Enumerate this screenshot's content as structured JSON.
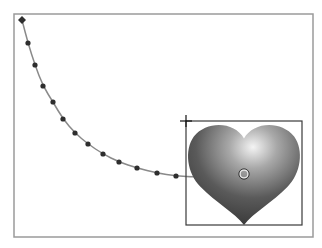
{
  "canvas": {
    "frame": {
      "x": 14,
      "y": 14,
      "w": 299,
      "h": 223,
      "stroke": "#9a9a9a"
    },
    "motion_path": {
      "stroke": "#8a8a8a",
      "dot_color": "#2e2e2e",
      "start_marker": {
        "x": 22,
        "y": 20
      },
      "points": [
        [
          28,
          43
        ],
        [
          35,
          65
        ],
        [
          43,
          86
        ],
        [
          53,
          102
        ],
        [
          63,
          119
        ],
        [
          75,
          133
        ],
        [
          88,
          144
        ],
        [
          103,
          154
        ],
        [
          119,
          162
        ],
        [
          137,
          168
        ],
        [
          157,
          173
        ],
        [
          176,
          176
        ],
        [
          197,
          177
        ],
        [
          221,
          175
        ]
      ],
      "end": {
        "x": 244,
        "y": 174
      }
    },
    "heart": {
      "x": 187,
      "y": 122,
      "w": 114,
      "h": 103,
      "highlight": "#f2f2f2",
      "mid": "#8c8c8c",
      "dark": "#3a3a3a"
    },
    "selection_box": {
      "x": 186,
      "y": 121,
      "w": 116,
      "h": 104,
      "stroke": "#3a3a3a"
    },
    "anchor_cross": {
      "x": 186,
      "y": 121
    },
    "center_handle": {
      "x": 244,
      "y": 174,
      "r": 4
    }
  }
}
